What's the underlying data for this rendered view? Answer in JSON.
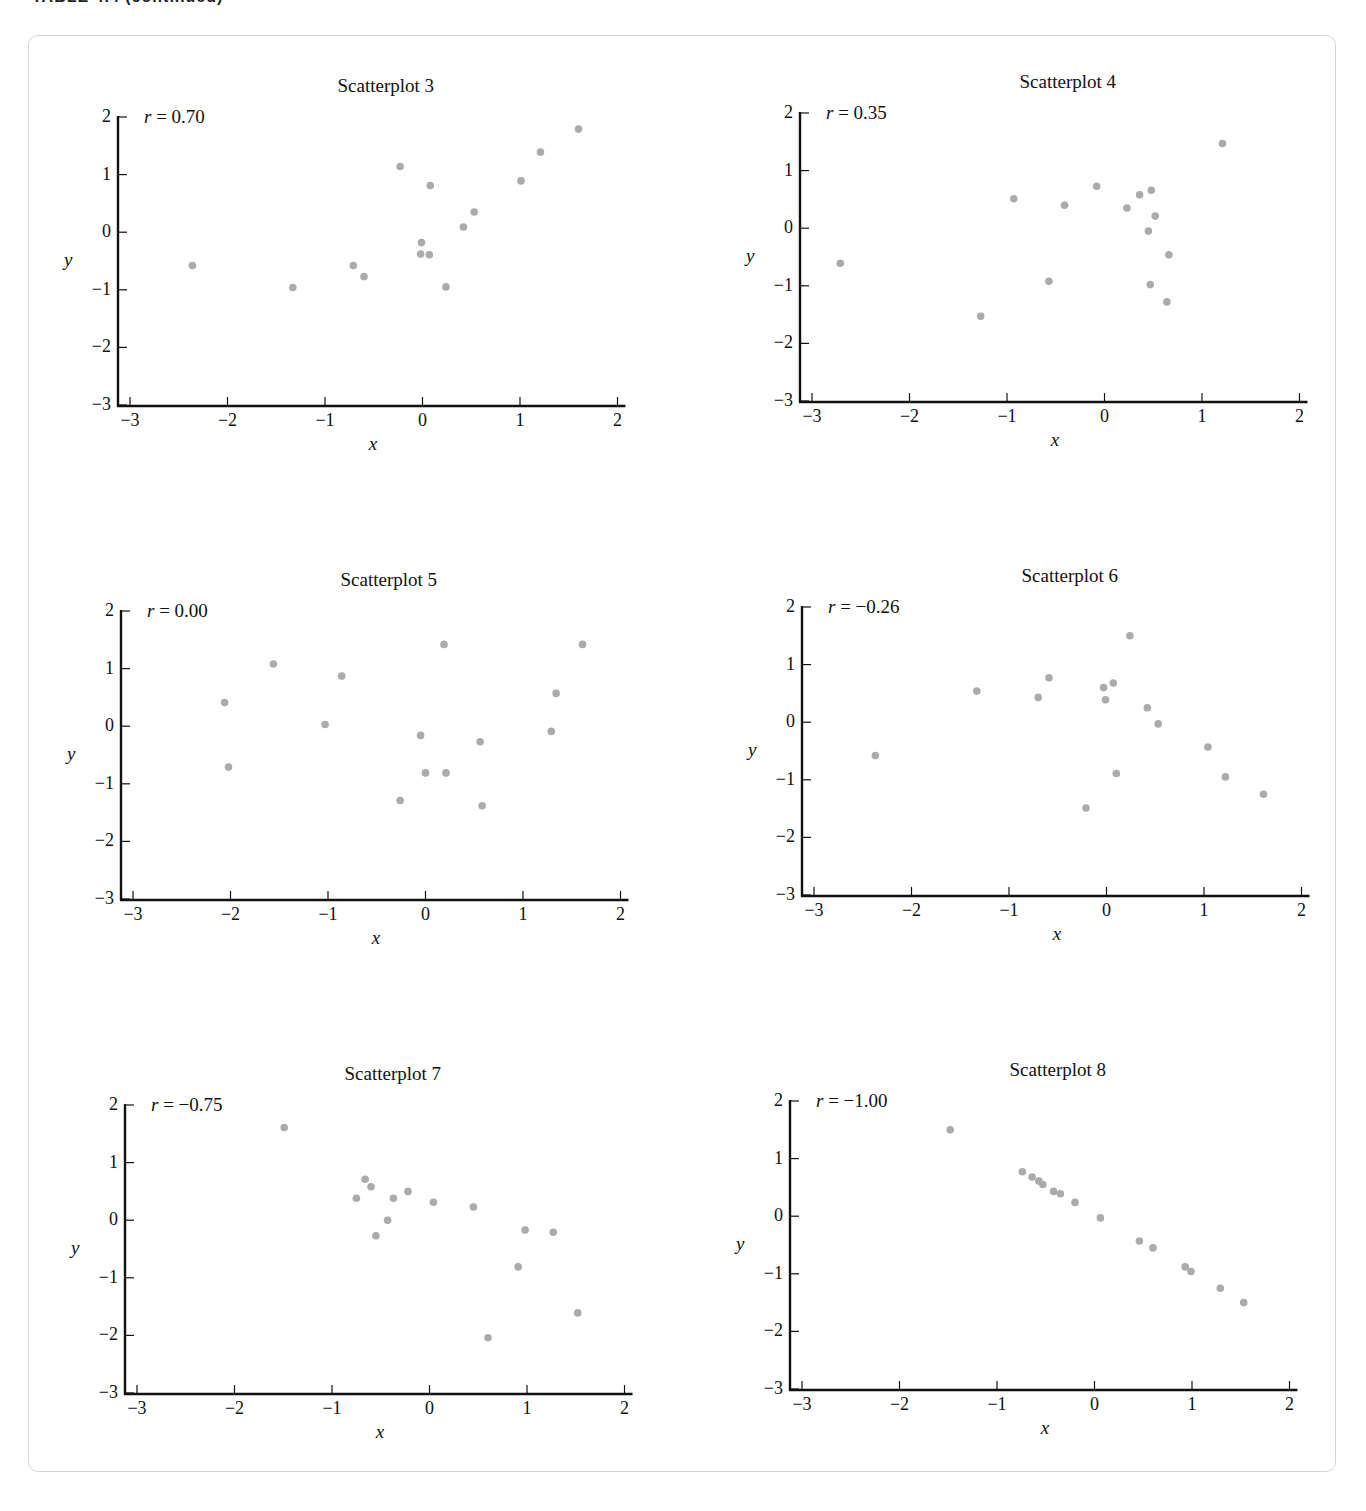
{
  "page": {
    "header": "TABLE 4.4 (continued)"
  },
  "chart_data": [
    {
      "type": "scatter",
      "title": "Scatterplot 3",
      "annotation": "r = 0.70",
      "r": "0.70",
      "xlabel": "x",
      "ylabel": "y",
      "xlim": [
        -3,
        2
      ],
      "ylim": [
        -3,
        2
      ],
      "xticks": [
        "−3",
        "−2",
        "−1",
        "0",
        "1",
        "2"
      ],
      "yticks": [
        "2",
        "1",
        "0",
        "−1",
        "−2",
        "−3"
      ],
      "grid": false,
      "point_color": "#ababab",
      "points": [
        [
          -2.36,
          -0.58
        ],
        [
          -1.33,
          -0.96
        ],
        [
          -0.71,
          -0.58
        ],
        [
          -0.6,
          -0.77
        ],
        [
          -0.23,
          1.14
        ],
        [
          -0.01,
          -0.18
        ],
        [
          -0.02,
          -0.38
        ],
        [
          0.07,
          -0.39
        ],
        [
          0.08,
          0.81
        ],
        [
          0.24,
          -0.95
        ],
        [
          0.42,
          0.09
        ],
        [
          0.53,
          0.35
        ],
        [
          1.01,
          0.89
        ],
        [
          1.21,
          1.39
        ],
        [
          1.6,
          1.79
        ]
      ]
    },
    {
      "type": "scatter",
      "title": "Scatterplot 4",
      "annotation": "r = 0.35",
      "r": "0.35",
      "xlabel": "x",
      "ylabel": "y",
      "xlim": [
        -3,
        2
      ],
      "ylim": [
        -3,
        2
      ],
      "xticks": [
        "−3",
        "−2",
        "−1",
        "0",
        "1",
        "2"
      ],
      "yticks": [
        "2",
        "1",
        "0",
        "−1",
        "−2",
        "−3"
      ],
      "grid": false,
      "point_color": "#ababab",
      "points": [
        [
          -2.71,
          -0.61
        ],
        [
          -1.27,
          -1.53
        ],
        [
          -0.93,
          0.51
        ],
        [
          -0.57,
          -0.92
        ],
        [
          -0.41,
          0.4
        ],
        [
          -0.08,
          0.73
        ],
        [
          0.23,
          0.35
        ],
        [
          0.36,
          0.58
        ],
        [
          0.45,
          -0.05
        ],
        [
          0.48,
          0.66
        ],
        [
          0.47,
          -0.98
        ],
        [
          0.52,
          0.21
        ],
        [
          0.64,
          -1.28
        ],
        [
          0.66,
          -0.46
        ],
        [
          1.21,
          1.47
        ]
      ]
    },
    {
      "type": "scatter",
      "title": "Scatterplot 5",
      "annotation": "r = 0.00",
      "r": "0.00",
      "xlabel": "x",
      "ylabel": "y",
      "xlim": [
        -3,
        2
      ],
      "ylim": [
        -3,
        2
      ],
      "xticks": [
        "−3",
        "−2",
        "−1",
        "0",
        "1",
        "2"
      ],
      "yticks": [
        "2",
        "1",
        "0",
        "−1",
        "−2",
        "−3"
      ],
      "grid": false,
      "point_color": "#ababab",
      "points": [
        [
          -2.06,
          0.41
        ],
        [
          -2.02,
          -0.71
        ],
        [
          -1.56,
          1.08
        ],
        [
          -1.03,
          0.03
        ],
        [
          -0.86,
          0.87
        ],
        [
          -0.26,
          -1.29
        ],
        [
          -0.05,
          -0.16
        ],
        [
          0.0,
          -0.81
        ],
        [
          0.19,
          1.42
        ],
        [
          0.21,
          -0.81
        ],
        [
          0.56,
          -0.27
        ],
        [
          0.58,
          -1.38
        ],
        [
          1.29,
          -0.09
        ],
        [
          1.34,
          0.57
        ],
        [
          1.61,
          1.42
        ]
      ]
    },
    {
      "type": "scatter",
      "title": "Scatterplot 6",
      "annotation": "r = −0.26",
      "r": "−0.26",
      "xlabel": "x",
      "ylabel": "y",
      "xlim": [
        -3,
        2
      ],
      "ylim": [
        -3,
        2
      ],
      "xticks": [
        "−3",
        "−2",
        "−1",
        "0",
        "1",
        "2"
      ],
      "yticks": [
        "2",
        "1",
        "0",
        "−1",
        "−2",
        "−3"
      ],
      "grid": false,
      "point_color": "#ababab",
      "points": [
        [
          -2.37,
          -0.58
        ],
        [
          -1.33,
          0.54
        ],
        [
          -0.7,
          0.43
        ],
        [
          -0.59,
          0.77
        ],
        [
          -0.21,
          -1.49
        ],
        [
          -0.03,
          0.6
        ],
        [
          -0.01,
          0.39
        ],
        [
          0.07,
          0.68
        ],
        [
          0.1,
          -0.89
        ],
        [
          0.24,
          1.5
        ],
        [
          0.42,
          0.25
        ],
        [
          0.53,
          -0.03
        ],
        [
          1.04,
          -0.43
        ],
        [
          1.22,
          -0.95
        ],
        [
          1.61,
          -1.25
        ]
      ]
    },
    {
      "type": "scatter",
      "title": "Scatterplot 7",
      "annotation": "r = −0.75",
      "r": "−0.75",
      "xlabel": "x",
      "ylabel": "y",
      "xlim": [
        -3,
        2
      ],
      "ylim": [
        -3,
        2
      ],
      "xticks": [
        "−3",
        "−2",
        "−1",
        "0",
        "1",
        "2"
      ],
      "yticks": [
        "2",
        "1",
        "0",
        "−1",
        "−2",
        "−3"
      ],
      "grid": false,
      "point_color": "#ababab",
      "points": [
        [
          -1.49,
          1.61
        ],
        [
          -0.75,
          0.38
        ],
        [
          -0.66,
          0.71
        ],
        [
          -0.6,
          0.58
        ],
        [
          -0.55,
          -0.27
        ],
        [
          -0.43,
          0.0
        ],
        [
          -0.37,
          0.38
        ],
        [
          -0.22,
          0.5
        ],
        [
          0.04,
          0.31
        ],
        [
          0.45,
          0.23
        ],
        [
          0.6,
          -2.04
        ],
        [
          0.91,
          -0.81
        ],
        [
          0.98,
          -0.17
        ],
        [
          1.27,
          -0.21
        ],
        [
          1.52,
          -1.61
        ]
      ]
    },
    {
      "type": "scatter",
      "title": "Scatterplot 8",
      "annotation": "r = −1.00",
      "r": "−1.00",
      "xlabel": "x",
      "ylabel": "y",
      "xlim": [
        -3,
        2
      ],
      "ylim": [
        -3,
        2
      ],
      "xticks": [
        "−3",
        "−2",
        "−1",
        "0",
        "1",
        "2"
      ],
      "yticks": [
        "2",
        "1",
        "0",
        "−1",
        "−2",
        "−3"
      ],
      "grid": false,
      "point_color": "#ababab",
      "points": [
        [
          -1.48,
          1.5
        ],
        [
          -0.74,
          0.77
        ],
        [
          -0.64,
          0.68
        ],
        [
          -0.57,
          0.61
        ],
        [
          -0.53,
          0.55
        ],
        [
          -0.42,
          0.43
        ],
        [
          -0.35,
          0.39
        ],
        [
          -0.2,
          0.24
        ],
        [
          0.06,
          -0.03
        ],
        [
          0.46,
          -0.43
        ],
        [
          0.6,
          -0.55
        ],
        [
          0.93,
          -0.88
        ],
        [
          0.99,
          -0.96
        ],
        [
          1.29,
          -1.25
        ],
        [
          1.53,
          -1.5
        ]
      ]
    }
  ]
}
